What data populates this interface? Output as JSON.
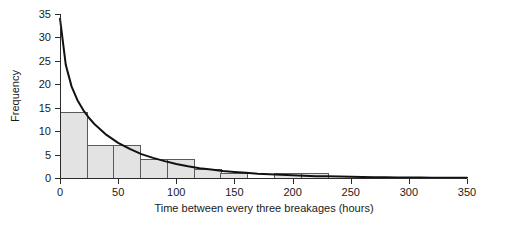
{
  "chart_data": {
    "type": "bar",
    "title": "",
    "subtitle": "",
    "xlabel": "Time between every three breakages (hours)",
    "ylabel": "Frequency",
    "xlim": [
      0,
      350
    ],
    "ylim": [
      0,
      35
    ],
    "xticks": [
      0,
      50,
      100,
      150,
      200,
      250,
      300,
      350
    ],
    "xtick_labels": [
      "0",
      "50",
      "100",
      "150",
      "200",
      "250",
      "300",
      "350"
    ],
    "yticks": [
      0,
      5,
      10,
      15,
      20,
      25,
      30,
      35
    ],
    "ytick_labels": [
      "0",
      "5",
      "10",
      "15",
      "20",
      "25",
      "30",
      "35"
    ],
    "grid": false,
    "legend": false,
    "bin_width": 23,
    "bins": [
      {
        "x0": 0,
        "x1": 23,
        "value": 14
      },
      {
        "x0": 23,
        "x1": 46,
        "value": 7
      },
      {
        "x0": 46,
        "x1": 69,
        "value": 7
      },
      {
        "x0": 69,
        "x1": 92,
        "value": 4
      },
      {
        "x0": 92,
        "x1": 115,
        "value": 4
      },
      {
        "x0": 115,
        "x1": 138,
        "value": 2
      },
      {
        "x0": 138,
        "x1": 161,
        "value": 1
      },
      {
        "x0": 161,
        "x1": 184,
        "value": 0
      },
      {
        "x0": 184,
        "x1": 207,
        "value": 1
      },
      {
        "x0": 207,
        "x1": 230,
        "value": 1
      },
      {
        "x0": 230,
        "x1": 253,
        "value": 0
      },
      {
        "x0": 253,
        "x1": 276,
        "value": 0
      },
      {
        "x0": 276,
        "x1": 299,
        "value": 0
      },
      {
        "x0": 299,
        "x1": 322,
        "value": 0
      },
      {
        "x0": 322,
        "x1": 345,
        "value": 0
      }
    ],
    "categories": [
      "0-23",
      "23-46",
      "46-69",
      "69-92",
      "92-115",
      "115-138",
      "138-161",
      "161-184",
      "184-207",
      "207-230",
      "230-253",
      "253-276",
      "276-299",
      "299-322",
      "322-345"
    ],
    "values": [
      14,
      7,
      7,
      4,
      4,
      2,
      1,
      0,
      1,
      1,
      0,
      0,
      0,
      0,
      0
    ],
    "series": [
      {
        "name": "fitted exponential curve",
        "type": "line",
        "model": "exponential decay",
        "amplitude": 34,
        "decay_constant": 45,
        "x": [
          0,
          5,
          10,
          15,
          20,
          25,
          30,
          40,
          50,
          60,
          70,
          80,
          90,
          100,
          110,
          120,
          130,
          140,
          150,
          160,
          170,
          180,
          190,
          200,
          210,
          220,
          230,
          240,
          250,
          260,
          270,
          280,
          290,
          300,
          310,
          320,
          330,
          340,
          350
        ],
        "values": [
          34.0,
          24.1,
          19.5,
          16.6,
          14.5,
          12.8,
          11.4,
          9.2,
          7.5,
          6.2,
          5.1,
          4.3,
          3.6,
          3.0,
          2.5,
          2.1,
          1.8,
          1.5,
          1.3,
          1.1,
          0.9,
          0.8,
          0.7,
          0.6,
          0.5,
          0.4,
          0.35,
          0.3,
          0.25,
          0.2,
          0.18,
          0.15,
          0.13,
          0.11,
          0.09,
          0.08,
          0.07,
          0.06,
          0.05
        ]
      }
    ],
    "colors": {
      "bar_fill": "#e3e3e3",
      "bar_stroke": "#5a5a5a",
      "curve": "#111111",
      "axis": "#2b2b2b",
      "text": "#1a1a1a",
      "background": "#ffffff"
    }
  }
}
